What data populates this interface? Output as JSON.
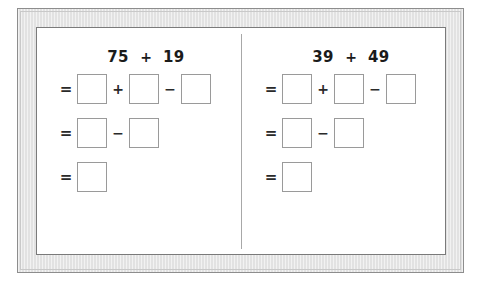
{
  "worksheet": {
    "title": "Two-column mental math decomposition worksheet",
    "frame": {
      "outer_border_color": "#8d8d8d",
      "mat_color": "#e2e2e2",
      "inner_border_color": "#7a7a7a",
      "content_background": "#ffffff"
    },
    "divider": {
      "name": "vertical-divider",
      "color": "#a8a8a8"
    },
    "box": {
      "border_color": "#9a9a9a",
      "fill_color": "#ffffff",
      "value": ""
    },
    "symbols": {
      "equals": "=",
      "plus": "+",
      "minus": "−"
    },
    "problems": [
      {
        "id": "problem-left",
        "heading": {
          "first_term": "75",
          "operator": "+",
          "second_term": "19"
        },
        "rows": [
          {
            "id": "row-1",
            "equals": "=",
            "cells": [
              {
                "type": "box",
                "value": ""
              },
              {
                "type": "operator",
                "value": "+"
              },
              {
                "type": "box",
                "value": ""
              },
              {
                "type": "operator",
                "value": "−"
              },
              {
                "type": "box",
                "value": ""
              }
            ]
          },
          {
            "id": "row-2",
            "equals": "=",
            "cells": [
              {
                "type": "box",
                "value": ""
              },
              {
                "type": "operator",
                "value": "−"
              },
              {
                "type": "box",
                "value": ""
              }
            ]
          },
          {
            "id": "row-3",
            "equals": "=",
            "cells": [
              {
                "type": "box",
                "value": ""
              }
            ]
          }
        ]
      },
      {
        "id": "problem-right",
        "heading": {
          "first_term": "39",
          "operator": "+",
          "second_term": "49"
        },
        "rows": [
          {
            "id": "row-1",
            "equals": "=",
            "cells": [
              {
                "type": "box",
                "value": ""
              },
              {
                "type": "operator",
                "value": "+"
              },
              {
                "type": "box",
                "value": ""
              },
              {
                "type": "operator",
                "value": "−"
              },
              {
                "type": "box",
                "value": ""
              }
            ]
          },
          {
            "id": "row-2",
            "equals": "=",
            "cells": [
              {
                "type": "box",
                "value": ""
              },
              {
                "type": "operator",
                "value": "−"
              },
              {
                "type": "box",
                "value": ""
              }
            ]
          },
          {
            "id": "row-3",
            "equals": "=",
            "cells": [
              {
                "type": "box",
                "value": ""
              }
            ]
          }
        ]
      }
    ]
  }
}
